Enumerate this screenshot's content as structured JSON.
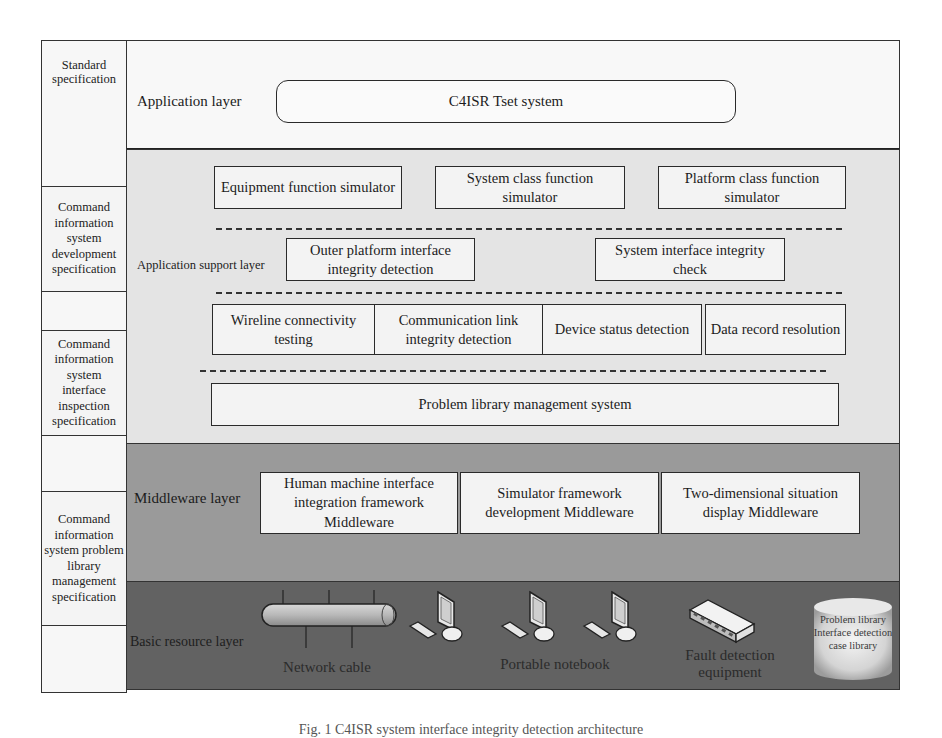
{
  "specifications": {
    "standard": "Standard specification",
    "development": "Command information system development specification",
    "interface_inspection": "Command information system interface inspection specification",
    "problem_library": "Command information system problem library management specification"
  },
  "layers": {
    "application": {
      "label": "Application layer",
      "system": "C4ISR Tset system"
    },
    "application_support": {
      "label": "Application support layer",
      "row1": [
        "Equipment function simulator",
        "System class function simulator",
        "Platform class function simulator"
      ],
      "row2": [
        "Outer platform interface integrity detection",
        "System interface integrity check"
      ],
      "row3": [
        "Wireline connectivity testing",
        "Communication link integrity detection",
        "Device status detection",
        "Data record resolution"
      ],
      "row4": "Problem library management system"
    },
    "middleware": {
      "label": "Middleware layer",
      "items": [
        "Human machine interface integration framework Middleware",
        "Simulator framework development Middleware",
        "Two-dimensional situation display Middleware"
      ]
    },
    "basic_resource": {
      "label": "Basic resource layer",
      "network_cable": "Network cable",
      "portable_notebook": "Portable notebook",
      "fault_detection": "Fault detection equipment",
      "database": "Problem library Interface detection case library"
    }
  },
  "caption": "Fig. 1   C4ISR system interface integrity detection architecture",
  "colors": {
    "application_bg": "#f8f8f8",
    "support_bg": "#e4e4e4",
    "middleware_bg": "#9a9a9a",
    "basic_bg": "#626262"
  }
}
